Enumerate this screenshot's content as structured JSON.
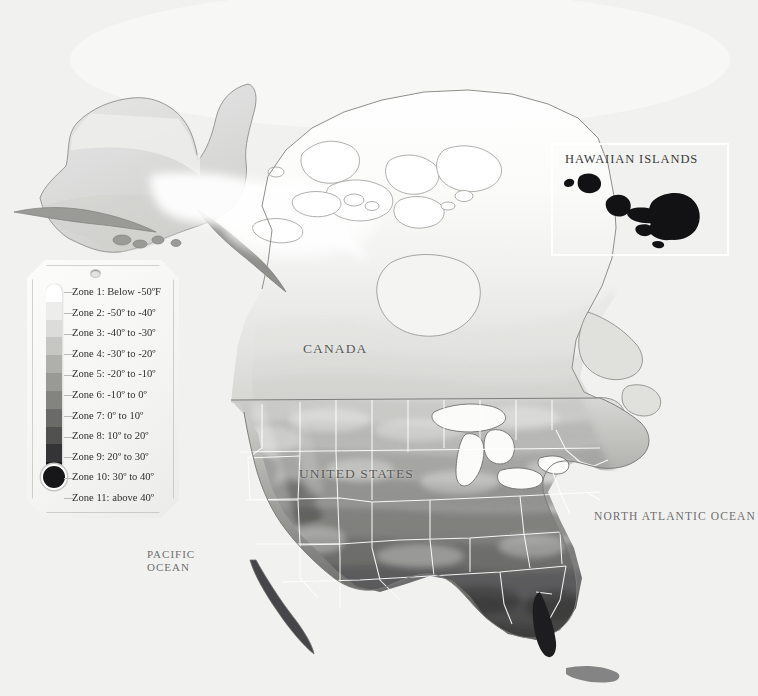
{
  "map": {
    "title": "Plant Hardiness Zone Map of North America",
    "background_color": "#f2f2f0",
    "labels": {
      "canada": "CANADA",
      "united_states": "UNITED STATES",
      "north_atlantic": "NORTH ATLANTIC OCEAN",
      "pacific_line1": "PACIFIC",
      "pacific_line2": "OCEAN"
    },
    "boundary_color": "#ffffff",
    "coastline_color": "#8a8a87"
  },
  "inset": {
    "title": "HAWAIIAN ISLANDS",
    "border_color": "#ffffff",
    "island_color": "#121214",
    "islands": [
      {
        "name": "Niihau"
      },
      {
        "name": "Kauai"
      },
      {
        "name": "Oahu"
      },
      {
        "name": "Molokai"
      },
      {
        "name": "Lanai"
      },
      {
        "name": "Maui"
      },
      {
        "name": "Kahoolawe"
      },
      {
        "name": "Hawaii"
      }
    ]
  },
  "legend": {
    "card_label": "hardiness-zone-legend",
    "thermometer_bulb_color": "#17171a",
    "zones": [
      {
        "label": "Zone 1: Below -50ºF",
        "number": 1,
        "range_low": null,
        "range_high": -50,
        "color": "#ffffff"
      },
      {
        "label": "Zone 2: -50º to -40º",
        "number": 2,
        "range_low": -50,
        "range_high": -40,
        "color": "#ededec"
      },
      {
        "label": "Zone 3: -40º to -30º",
        "number": 3,
        "range_low": -40,
        "range_high": -30,
        "color": "#dcdcda"
      },
      {
        "label": "Zone 4: -30º to -20º",
        "number": 4,
        "range_low": -30,
        "range_high": -20,
        "color": "#c6c6c3"
      },
      {
        "label": "Zone 5: -20º to -10º",
        "number": 5,
        "range_low": -20,
        "range_high": -10,
        "color": "#afafac"
      },
      {
        "label": "Zone 6: -10º to 0º",
        "number": 6,
        "range_low": -10,
        "range_high": 0,
        "color": "#999996"
      },
      {
        "label": "Zone 7: 0º to 10º",
        "number": 7,
        "range_low": 0,
        "range_high": 10,
        "color": "#83837f"
      },
      {
        "label": "Zone 8: 10º to 20º",
        "number": 8,
        "range_low": 10,
        "range_high": 20,
        "color": "#6a6a67"
      },
      {
        "label": "Zone 9: 20º to 30º",
        "number": 9,
        "range_low": 20,
        "range_high": 30,
        "color": "#515150"
      },
      {
        "label": "Zone 10: 30º to 40º",
        "number": 10,
        "range_low": 30,
        "range_high": 40,
        "color": "#343436"
      },
      {
        "label": "Zone 11: above 40º",
        "number": 11,
        "range_low": 40,
        "range_high": null,
        "color": "#17171a"
      }
    ]
  }
}
